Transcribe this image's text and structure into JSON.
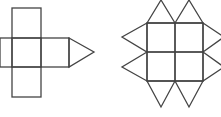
{
  "diagram": {
    "stroke_color": "#444444",
    "background": "#ffffff",
    "figures": [
      {
        "id": "net-left",
        "shape": "cross of five squares with one triangle attached to right",
        "squares": [
          {
            "x": 12,
            "y": 8,
            "w": 29,
            "h": 30
          },
          {
            "x": 0,
            "y": 38,
            "w": 12,
            "h": 29
          },
          {
            "x": 12,
            "y": 38,
            "w": 29,
            "h": 29
          },
          {
            "x": 41,
            "y": 38,
            "w": 28,
            "h": 29
          },
          {
            "x": 12,
            "y": 67,
            "w": 29,
            "h": 30
          }
        ],
        "triangles": [
          {
            "points": "69,38 94,52 69,67"
          }
        ]
      },
      {
        "id": "net-right",
        "shape": "2x2 square grid with eight triangles around the edges",
        "squares": [
          {
            "x": 147,
            "y": 23,
            "w": 28,
            "h": 29
          },
          {
            "x": 175,
            "y": 23,
            "w": 28,
            "h": 29
          },
          {
            "x": 147,
            "y": 52,
            "w": 28,
            "h": 29
          },
          {
            "x": 175,
            "y": 52,
            "w": 28,
            "h": 29
          }
        ],
        "triangles": [
          {
            "points": "147,23 161,0 175,23"
          },
          {
            "points": "175,23 189,0 203,23"
          },
          {
            "points": "147,81 161,107 175,81"
          },
          {
            "points": "175,81 189,107 203,81"
          },
          {
            "points": "147,23 122,37 147,52"
          },
          {
            "points": "147,52 122,67 147,81"
          },
          {
            "points": "203,23 224,37 203,52"
          },
          {
            "points": "203,52 224,67 203,81"
          }
        ]
      }
    ]
  }
}
